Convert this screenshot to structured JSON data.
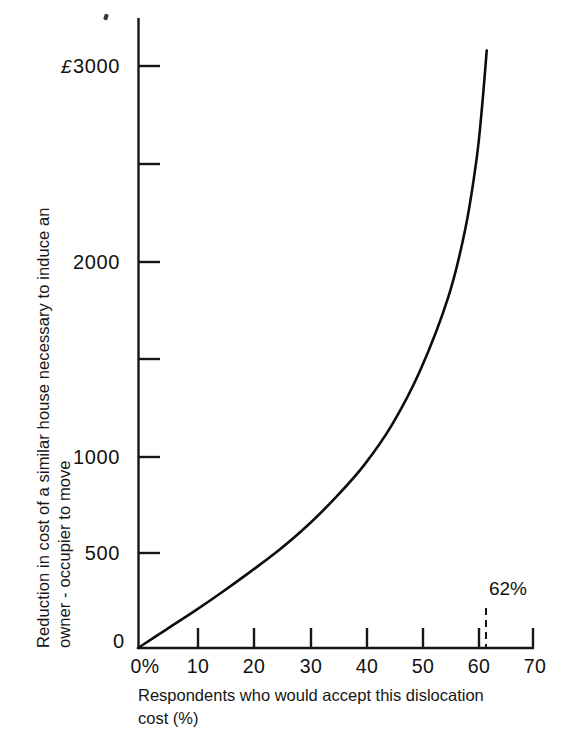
{
  "chart_data": {
    "type": "line",
    "title": "",
    "subtitle": "",
    "xlabel": "Respondents who would accept this dislocation\ncost (%)",
    "ylabel_line1": "Reduction in cost of a similar house necessary to induce an",
    "ylabel_line2": "owner - occupier to move",
    "xlim": [
      0,
      70
    ],
    "ylim": [
      0,
      3100
    ],
    "grid": false,
    "legend": "none",
    "x_ticks": [
      0,
      10,
      20,
      30,
      40,
      50,
      60,
      70
    ],
    "x_tick_labels": [
      "0%",
      "10",
      "20",
      "30",
      "40",
      "50",
      "60",
      "70"
    ],
    "y_ticks": [
      0,
      500,
      1000,
      1500,
      2000,
      2500,
      3000
    ],
    "y_tick_labels": [
      "0",
      "500",
      "1000",
      "",
      "2000",
      "",
      "3000"
    ],
    "y_tick_label_3000_prefix": "£",
    "y_axis_currency": "£",
    "series": [
      {
        "name": "Dislocation cost curve",
        "x": [
          0,
          5,
          10,
          15,
          20,
          25,
          30,
          35,
          40,
          45,
          50,
          55,
          58,
          60,
          61,
          61.8
        ],
        "y": [
          0,
          95,
          190,
          290,
          395,
          505,
          630,
          775,
          940,
          1150,
          1430,
          1810,
          2160,
          2520,
          2800,
          3080
        ]
      }
    ],
    "annotations": [
      {
        "name": "62-percent-marker",
        "label": "62%",
        "x": 61.8,
        "style": "dashed-vertical-line"
      }
    ]
  },
  "axis": {
    "tick_0_label": "0",
    "tick_500_label": "500",
    "tick_1000_label": "1000",
    "tick_2000_label": "2000",
    "tick_3000_label": "3000",
    "pound_sign": "£",
    "x_0_label": "0%",
    "x_10_label": "10",
    "x_20_label": "20",
    "x_30_label": "30",
    "x_40_label": "40",
    "x_50_label": "50",
    "x_60_label": "60",
    "x_70_label": "70"
  },
  "annotation": {
    "percent_marker": "62%"
  },
  "colors": {
    "ink": "#141414",
    "curve": "#0d0d0d",
    "paper": "#ffffff"
  }
}
